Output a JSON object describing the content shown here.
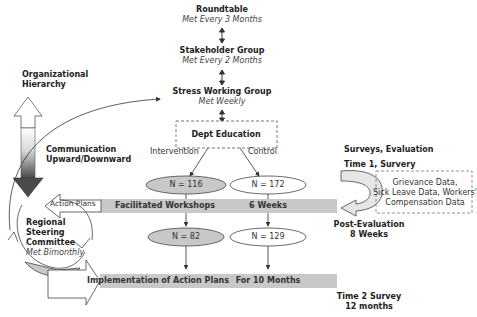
{
  "hierarchy": {
    "roundtable": {
      "title": "Roundtable",
      "frequency": "Met Every 3 Months"
    },
    "stakeholder": {
      "title": "Stakeholder Group",
      "frequency": "Met Every 2 Months"
    },
    "stress_working": {
      "title": "Stress Working Group",
      "frequency": "Met Weekly"
    },
    "dept_education": {
      "title": "Dept Education"
    }
  },
  "left_panel": {
    "org_hierarchy": "Organizational\nHierarchy",
    "org_line1": "Organizational",
    "org_line2": "Hierarchy",
    "comm_line1": "Communication",
    "comm_line2": "Upward/Downward",
    "action_plans": "Action Plans",
    "committee": {
      "line1": "Regional",
      "line2": "Steering",
      "line3": "Committee",
      "line4": "Met Bimonthly"
    }
  },
  "branches": {
    "intervention_label": "Intervention",
    "control_label": "Control"
  },
  "groups": {
    "intervention_start": "N = 116",
    "control_start": "N = 172",
    "intervention_end": "N = 82",
    "control_end": "N = 129"
  },
  "bands": {
    "workshops": {
      "label": "Facilitated Workshops",
      "duration": "6 Weeks"
    },
    "implementation": {
      "label": "Implementation of Action Plans",
      "duration": "For 10 Months"
    }
  },
  "evaluation": {
    "header": "Surveys, Evaluation",
    "time1": "Time 1, Survery",
    "post_line1": "Post-Evaluation",
    "post_line2": "8 Weeks",
    "time2_line1": "Time 2 Survey",
    "time2_line2": "12 months",
    "data_box": {
      "line1": "Grievance Data,",
      "line2": "Sick Leave Data, Workers'",
      "line3": "Compensation Data"
    }
  },
  "colors": {
    "band": "#c8c8c8",
    "ellipse_fill": "#c8c8c8",
    "arrow_dark": "#555555",
    "arrow_light": "#e8e8e8"
  }
}
